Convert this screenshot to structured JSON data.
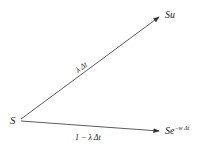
{
  "diagram": {
    "type": "binomial-tree-branch",
    "root": {
      "label": "S"
    },
    "up_node": {
      "label": "Su"
    },
    "down_node": {
      "label_base": "Se",
      "label_exponent": "−w Δt"
    },
    "up_edge": {
      "label": "λ Δt"
    },
    "down_edge": {
      "label": "1 − λ Δt"
    },
    "colors": {
      "line": "#333333",
      "text": "#222222",
      "background": "#ffffff"
    }
  }
}
